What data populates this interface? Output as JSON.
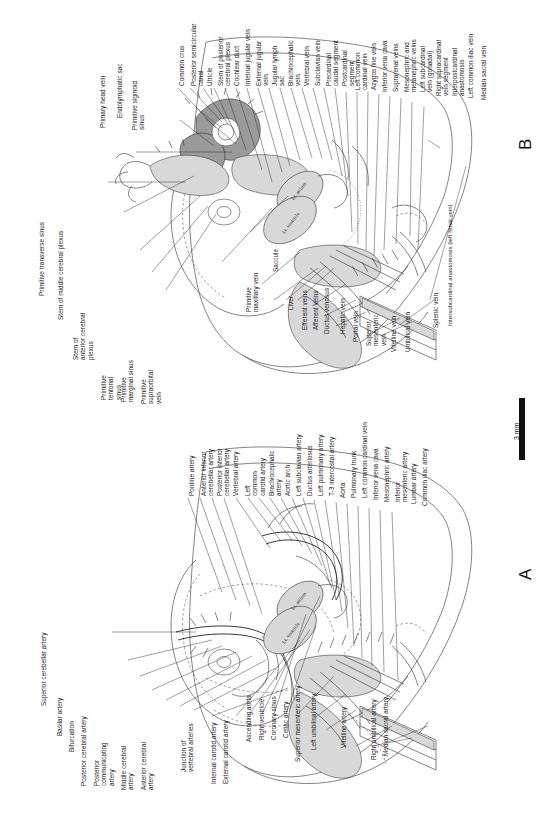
{
  "figure": {
    "type": "anatomical-plate",
    "scale_bar": {
      "label": "3 mm"
    },
    "panels": [
      {
        "id": "A",
        "letter": "A",
        "subject": "arterial system"
      },
      {
        "id": "B",
        "letter": "B",
        "subject": "venous system"
      }
    ]
  },
  "panel_a": {
    "letter": "A",
    "chamber_labels": [
      "Lt. atrium",
      "Lt. ventricle"
    ],
    "labels_left_column": [
      "Superior cerebellar artery",
      "Basilar artery",
      "Bifurcation",
      "Posterior cerebral artery",
      "Posterior\ncommunicating\nartery",
      "Middle cerebral\nartery",
      "Anterior cerebral\nartery",
      "Junction of\nvertebral arteries",
      "Internal carotid artery",
      "External carotid artery",
      "Ascending aorta",
      "Right ventricle",
      "Coronary sinus",
      "Celiac artery",
      "Superior mesenteric artery",
      "Left umbilical artery",
      "Vitelline artery",
      "Right umbilical artery",
      "Median sacral artery"
    ],
    "labels_upper_column": [
      "Pontine artery",
      "Anterior inferior\ncerebellar artery",
      "Posterior inferior\ncerebellar artery",
      "Vertebral artery",
      "Left\ncommon\ncarotid artery",
      "Brachiocephalic\nartery",
      "Aortic arch",
      "Left subclavian artery",
      "Ductus arteriosus",
      "Left pulmonary artery",
      "T-3 intercostal artery",
      "Aorta",
      "Pulmonary trunk",
      "Left common cardinal vein",
      "Inferior vena cava",
      "Mesonephric artery",
      "Inferior\nmesenteric artery",
      "Lumbar artery",
      "Common iliac artery"
    ]
  },
  "panel_b": {
    "letter": "B",
    "chamber_labels": [
      "Lt. atrium",
      "Lt. ventricle"
    ],
    "labels_left_column": [
      "Primitive transverse sinus",
      "Stem of middle cerebral plexus",
      "Stem of\nanterior cerebral\nplexus",
      "Primitive\ntentorial\nsinus",
      "Primitive\nmarginal sinus",
      "Primitive\nsupraorbital\nvein",
      "Primary head vein",
      "Endolymphatic sac",
      "Primitive sigmoid\nsinus",
      "Primitive\nmaxillary vein",
      "Saccule",
      "Liver",
      "Efferent veins",
      "Afferent veins",
      "Ductus venosus",
      "Hepatic vein",
      "Portal vein",
      "Superior\nmesenteric\nvein",
      "Vitelline vein",
      "Umbilical vein",
      "Splenic vein"
    ],
    "labels_upper_column": [
      "Common crus",
      "Posterior semicircular\ncanal",
      "Utricle",
      "Stem of posterior\ncerebral plexus",
      "Cochlear duct",
      "Internal jugular vein",
      "External jugular\nvein",
      "Jugular lymph\nsac",
      "Brachiocephalic\nvein",
      "Vertebral vein",
      "Subclavian vein",
      "Precardinal\ncaudal segment",
      "Postcardinal\nsegment",
      "Left common\ncardinal vein",
      "Azygos line vein",
      "Inferior vena cava",
      "Suprarenal veins",
      "Mesonephric and\nmetanephric veins",
      "Left subcardinal\nvein (gonadal)",
      "Right supracardinal\nvein segment",
      "Interpostcardinal\nanastomosis",
      "Left common iliac vein",
      "Median sacral vein"
    ],
    "labels_bottom": [
      "Intersubcardinal anastomosis (left renal vein)"
    ],
    "inline_labels": [
      "gonad"
    ]
  },
  "colors": {
    "ink": "#1a1a1a",
    "line": "#2b2b2b",
    "stipple": "#d8d8d8",
    "hatch": "#9a9a9a",
    "page": "#ffffff"
  }
}
